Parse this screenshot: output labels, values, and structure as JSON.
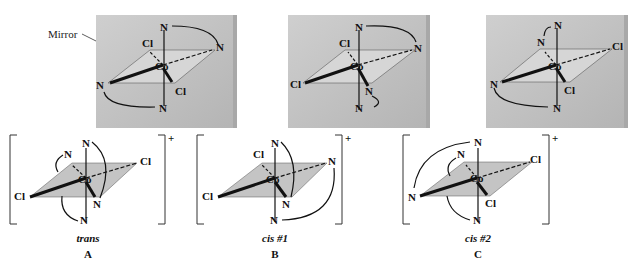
{
  "figure": {
    "mirror_label": "Mirror",
    "charge": "+",
    "atoms": {
      "metal": "Co",
      "ligand_n": "N",
      "ligand_cl": "Cl"
    },
    "isomers": [
      {
        "id": "A",
        "name": "trans",
        "letter": "A"
      },
      {
        "id": "B",
        "name": "cis #1",
        "letter": "B"
      },
      {
        "id": "C",
        "name": "cis #2",
        "letter": "C"
      }
    ],
    "colors": {
      "mirror": "#bdbdbd",
      "mirror_edge": "#9a9a9a",
      "plane": "#c8c8c8",
      "ink": "#111111",
      "background": "#ffffff"
    }
  }
}
